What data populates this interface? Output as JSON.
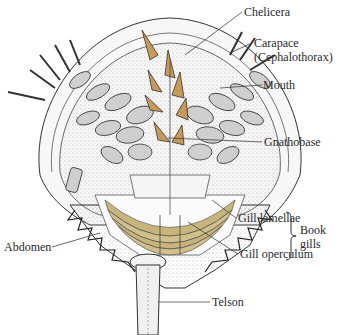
{
  "diagram": {
    "colors": {
      "outline": "#333333",
      "limb_fill": "#cfcfcf",
      "chelicera_fill": "#c89a55",
      "gill_fill": "#c8b57a",
      "stipple": "#9a9a9a",
      "leader_line": "#444444"
    },
    "labels": {
      "chelicera": "Chelicera",
      "carapace_line1": "Carapace",
      "carapace_line2": "(Cephalothorax)",
      "mouth": "Mouth",
      "gnathobase": "Gnathobase",
      "gill_lamellae": "Gill lamellae",
      "gill_operculum": "Gill operculum",
      "book_gills_line1": "Book",
      "book_gills_line2": "gills",
      "abdomen": "Abdomen",
      "telson": "Telson"
    }
  }
}
